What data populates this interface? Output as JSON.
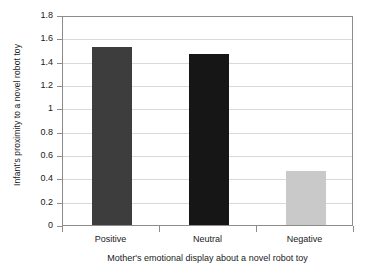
{
  "chart_data": {
    "type": "bar",
    "title": "",
    "subtitle": "",
    "categories": [
      "Positive",
      "Neutral",
      "Negative"
    ],
    "values": [
      1.53,
      1.47,
      0.46
    ],
    "xlabel": "Mother's emotional display about a novel robot toy",
    "ylabel": "Infant's proximity to a novel robot toy",
    "ylim": [
      0,
      1.8
    ],
    "ytick_labels": [
      "0",
      "0.2",
      "0.4",
      "0.6",
      "0.8",
      "1",
      "1.2",
      "1.4",
      "1.6",
      "1.8"
    ],
    "ytick_values": [
      0,
      0.2,
      0.4,
      0.6,
      0.8,
      1.0,
      1.2,
      1.4,
      1.6,
      1.8
    ],
    "grid": "horizontal",
    "legend": "none",
    "bar_colors": [
      "#3d3d3d",
      "#161616",
      "#c9c9c9"
    ],
    "grid_color": "#d9d9d9",
    "axis_color": "#8c8c8c",
    "background_color": "#ffffff",
    "text_color": "#1a1a1a"
  }
}
